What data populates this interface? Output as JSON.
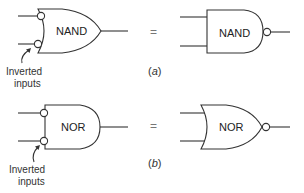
{
  "figure": {
    "panel_a": {
      "left_gate": {
        "type": "OR with inverted inputs",
        "label": "NAND"
      },
      "equals": "=",
      "right_gate": {
        "type": "AND with inverted output",
        "label": "NAND"
      },
      "annotation": [
        "Inverted",
        "inputs"
      ],
      "caption_open": "(",
      "caption_letter": "a",
      "caption_close": ")"
    },
    "panel_b": {
      "left_gate": {
        "type": "AND with inverted inputs",
        "label": "NOR"
      },
      "equals": "=",
      "right_gate": {
        "type": "OR with inverted output",
        "label": "NOR"
      },
      "annotation": [
        "Inverted",
        "inputs"
      ],
      "caption_open": "(",
      "caption_letter": "b",
      "caption_close": ")"
    }
  }
}
